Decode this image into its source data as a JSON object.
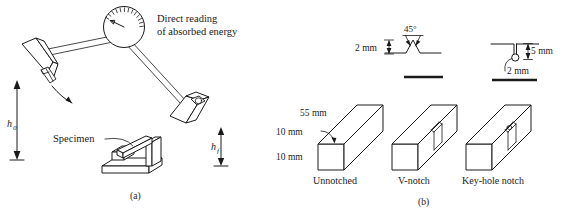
{
  "figure": {
    "line_color": "#1a1a1a",
    "background": "#ffffff"
  },
  "panel_a": {
    "caption": "(a)",
    "dial_label_line1": "Direct reading",
    "dial_label_line2": "of absorbed energy",
    "specimen_label": "Specimen",
    "height_initial": "h",
    "height_initial_sub": "0",
    "height_final": "h",
    "height_final_sub": "f",
    "dial_name": "absorbed-energy-dial",
    "tick_count": 13
  },
  "panel_b": {
    "caption": "(b)",
    "specimens": [
      {
        "name": "unnotched",
        "label": "Unnotched",
        "dim_length": "55 mm",
        "dim_width": "10 mm",
        "dim_height": "10 mm"
      },
      {
        "name": "v-notch",
        "label": "V-notch",
        "detail": {
          "angle": "45°",
          "depth": "2 mm"
        }
      },
      {
        "name": "key-hole-notch",
        "label": "Key-hole notch",
        "detail": {
          "depth": "5 mm",
          "hole_diameter": "2 mm"
        }
      }
    ]
  }
}
